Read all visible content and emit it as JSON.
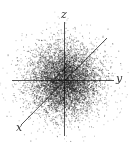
{
  "figure": {
    "title_cropped": "",
    "axes": {
      "x_label": "x",
      "y_label": "y",
      "z_label": "z",
      "color": "#555555"
    },
    "cloud": {
      "type": "3D gaussian point cloud",
      "center": [
        64,
        80
      ],
      "sigma": 17,
      "points": 14000,
      "outliers": 180,
      "color": "#1a1a1a"
    }
  }
}
